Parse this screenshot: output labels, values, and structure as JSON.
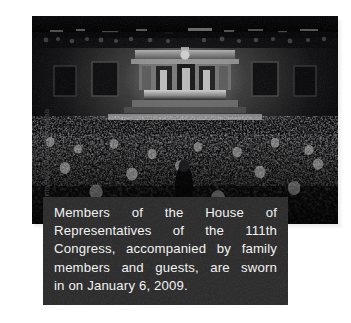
{
  "page": {
    "background_color": "#ffffff",
    "width": 351,
    "height": 323
  },
  "figure": {
    "photo": {
      "name": "house-chamber-photograph",
      "alt": "Black and white photograph of the United States House of Representatives chamber filled with members, family and guests during the swearing-in of the 111th Congress",
      "treatment": "black-and-white",
      "scene_elements": [
        "speaker-rostrum",
        "house-chamber-dais",
        "american-flag-backdrop",
        "gallery-balcony",
        "dense-crowd-of-members-and-guests"
      ]
    },
    "credit": {
      "text": "AP Photo/Pablo Martinez Monsivais",
      "orientation": "vertical-bottom-to-top",
      "color": "#4c4c4c"
    },
    "caption": {
      "background_color": "#2e2e2e",
      "text_color": "#f2f2f2",
      "full_text": "Members of the House of Representatives of the 111th Congress, accompanied by family members and guests, are sworn in on January 6, 2009.",
      "lines": [
        {
          "align": "justify",
          "words": [
            "Members",
            "of",
            "the",
            "House",
            "of"
          ]
        },
        {
          "align": "justify",
          "words": [
            "Representatives",
            "of",
            "the",
            "111th"
          ]
        },
        {
          "align": "justify",
          "words": [
            "Congress,",
            "accompanied",
            "by",
            "family"
          ]
        },
        {
          "align": "justify",
          "words": [
            "members",
            "and",
            "guests,",
            "are",
            "sworn"
          ]
        },
        {
          "align": "left",
          "text": "in on January 6, 2009."
        }
      ]
    }
  }
}
